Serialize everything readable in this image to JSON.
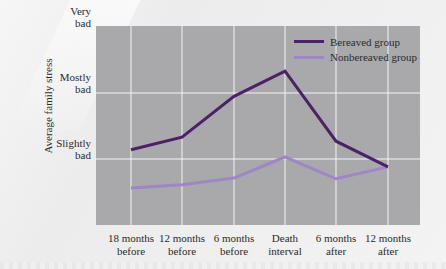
{
  "chart_data": {
    "type": "line",
    "title": "",
    "xlabel": "",
    "ylabel": "Average family stress",
    "categories": [
      "18 months before",
      "12 months before",
      "6 months before",
      "Death interval",
      "6 months after",
      "12 months after"
    ],
    "category_lines": [
      [
        "18 months",
        "before"
      ],
      [
        "12 months",
        "before"
      ],
      [
        "6 months",
        "before"
      ],
      [
        "Death",
        "interval"
      ],
      [
        "6 months",
        "after"
      ],
      [
        "12 months",
        "after"
      ]
    ],
    "y_ticks": [
      {
        "value": 1,
        "lines": [
          "Slightly",
          "bad"
        ]
      },
      {
        "value": 2,
        "lines": [
          "Mostly",
          "bad"
        ]
      },
      {
        "value": 3,
        "lines": [
          "Very",
          "bad"
        ]
      }
    ],
    "ylim": [
      0,
      3
    ],
    "grid": true,
    "legend_position": "upper right",
    "series": [
      {
        "name": "Bereaved group",
        "color": "#4b2266",
        "values": [
          1.14,
          1.33,
          1.95,
          2.33,
          1.27,
          0.88
        ]
      },
      {
        "name": "Nonbereaved group",
        "color": "#9f86c6",
        "values": [
          0.56,
          0.61,
          0.71,
          1.03,
          0.7,
          0.88
        ]
      }
    ]
  },
  "colors": {
    "plot_background": "#a9a9ab",
    "grid": "#f4f4f4",
    "page_background": "#f1f1f1"
  }
}
